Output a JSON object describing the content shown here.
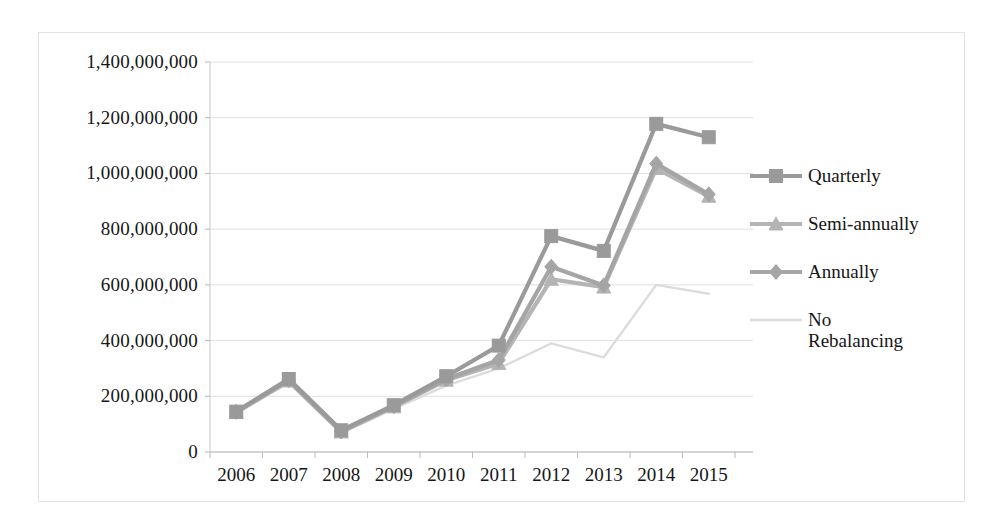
{
  "chart_data": {
    "type": "line",
    "title": "",
    "xlabel": "",
    "ylabel": "",
    "categories": [
      "2006",
      "2007",
      "2008",
      "2009",
      "2010",
      "2011",
      "2012",
      "2013",
      "2014",
      "2015"
    ],
    "ylim": [
      0,
      1400000000
    ],
    "ytick_values": [
      0,
      200000000,
      400000000,
      600000000,
      800000000,
      1000000000,
      1200000000,
      1400000000
    ],
    "ytick_labels": [
      "0",
      "200,000,000",
      "400,000,000",
      "600,000,000",
      "800,000,000",
      "1,000,000,000",
      "1,200,000,000",
      "1,400,000,000"
    ],
    "grid": true,
    "legend_position": "right",
    "series": [
      {
        "name": "Quarterly",
        "marker": "square",
        "color": "#9a9a9a",
        "values": [
          145000000,
          262000000,
          78000000,
          168000000,
          272000000,
          382000000,
          775000000,
          722000000,
          1178000000,
          1130000000
        ]
      },
      {
        "name": "Semi-annually",
        "marker": "triangle",
        "color": "#b4b4b4",
        "values": [
          142000000,
          255000000,
          72000000,
          162000000,
          258000000,
          318000000,
          620000000,
          592000000,
          1018000000,
          918000000
        ]
      },
      {
        "name": "Annually",
        "marker": "diamond",
        "color": "#a5a5a5",
        "values": [
          144000000,
          258000000,
          74000000,
          165000000,
          262000000,
          330000000,
          665000000,
          598000000,
          1035000000,
          925000000
        ]
      },
      {
        "name": "No\nRebalancing",
        "marker": "none",
        "color": "#dcdcdc",
        "values": [
          140000000,
          248000000,
          68000000,
          155000000,
          238000000,
          300000000,
          390000000,
          340000000,
          600000000,
          568000000
        ]
      }
    ]
  },
  "legend": {
    "entries": [
      {
        "label": "Quarterly"
      },
      {
        "label": "Semi-annually"
      },
      {
        "label": "Annually"
      },
      {
        "label": "No\nRebalancing"
      }
    ]
  }
}
